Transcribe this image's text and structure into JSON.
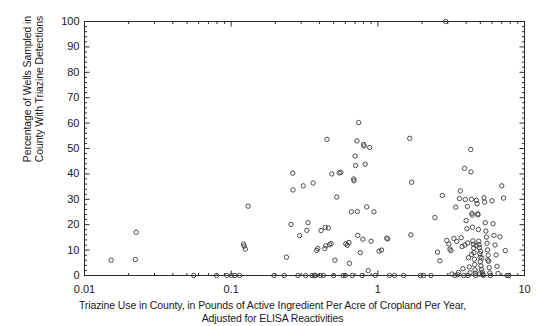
{
  "chart_data": {
    "type": "scatter",
    "title": "",
    "xlabel_lines": [
      "Triazine Use in County, in Pounds of Active Ingredient Per Acre of Cropland Per Year,",
      "Adjusted for ELISA Reactivities"
    ],
    "ylabel_lines": [
      "Percentage of Wells Sampled in",
      "County With Triazine Detections"
    ],
    "xlabel": "Triazine Use in County, in Pounds of Active Ingredient Per Acre of Cropland Per Year, Adjusted for ELISA Reactivities",
    "ylabel": "Percentage of Wells Sampled in County With Triazine Detections",
    "xscale": "log",
    "yscale": "linear",
    "xlim": [
      0.01,
      10
    ],
    "ylim": [
      0,
      100
    ],
    "xticks": [
      0.01,
      0.1,
      1,
      10
    ],
    "xtick_labels": [
      "0.01",
      "0.1",
      "1",
      "10"
    ],
    "yticks": [
      0,
      10,
      20,
      30,
      40,
      50,
      60,
      70,
      80,
      90,
      100
    ],
    "ytick_labels": [
      "0",
      "10",
      "20",
      "30",
      "40",
      "50",
      "60",
      "70",
      "80",
      "90",
      "100"
    ],
    "minor_ticks": true,
    "grid": false,
    "legend": null,
    "marker": "open-circle",
    "marker_color": "#3a3a3a",
    "marker_size": 4.4,
    "frame_color": "#2b2b2b",
    "background": "#ffffff",
    "points": [
      [
        0.0152,
        6.0
      ],
      [
        0.0222,
        6.3
      ],
      [
        0.0225,
        17.0
      ],
      [
        0.0555,
        0.0
      ],
      [
        0.0795,
        0.0
      ],
      [
        0.0935,
        0.0
      ],
      [
        0.1005,
        0.0
      ],
      [
        0.106,
        0.0
      ],
      [
        0.114,
        0.0
      ],
      [
        0.1215,
        12.4
      ],
      [
        0.1225,
        11.6
      ],
      [
        0.125,
        10.4
      ],
      [
        0.1305,
        27.3
      ],
      [
        0.196,
        0.0
      ],
      [
        0.23,
        0.0
      ],
      [
        0.238,
        7.2
      ],
      [
        0.256,
        20.1
      ],
      [
        0.263,
        40.3
      ],
      [
        0.264,
        33.7
      ],
      [
        0.285,
        0.0
      ],
      [
        0.293,
        15.7
      ],
      [
        0.31,
        35.3
      ],
      [
        0.322,
        0.0
      ],
      [
        0.328,
        17.8
      ],
      [
        0.334,
        20.8
      ],
      [
        0.356,
        0.0
      ],
      [
        0.362,
        36.4
      ],
      [
        0.37,
        0.0
      ],
      [
        0.376,
        0.0
      ],
      [
        0.382,
        9.9
      ],
      [
        0.39,
        10.6
      ],
      [
        0.405,
        0.0
      ],
      [
        0.41,
        17.7
      ],
      [
        0.425,
        0.0
      ],
      [
        0.435,
        10.6
      ],
      [
        0.442,
        11.7
      ],
      [
        0.45,
        53.6
      ],
      [
        0.46,
        18.7
      ],
      [
        0.47,
        12.1
      ],
      [
        0.48,
        12.6
      ],
      [
        0.485,
        40.0
      ],
      [
        0.5,
        0.0
      ],
      [
        0.51,
        6.0
      ],
      [
        0.525,
        30.9
      ],
      [
        0.545,
        40.4
      ],
      [
        0.56,
        40.6
      ],
      [
        0.58,
        0.0
      ],
      [
        0.6,
        0.0
      ],
      [
        0.62,
        11.9
      ],
      [
        0.635,
        13.0
      ],
      [
        0.64,
        4.8
      ],
      [
        0.66,
        25.1
      ],
      [
        0.67,
        0.0
      ],
      [
        0.685,
        38.0
      ],
      [
        0.688,
        37.3
      ],
      [
        0.7,
        47.0
      ],
      [
        0.705,
        43.3
      ],
      [
        0.72,
        53.0
      ],
      [
        0.725,
        25.2
      ],
      [
        0.73,
        15.8
      ],
      [
        0.74,
        60.2
      ],
      [
        0.76,
        9.0
      ],
      [
        0.78,
        0.0
      ],
      [
        0.8,
        51.6
      ],
      [
        0.805,
        51.0
      ],
      [
        0.82,
        43.8
      ],
      [
        0.84,
        27.0
      ],
      [
        0.86,
        1.9
      ],
      [
        0.88,
        50.4
      ],
      [
        0.9,
        13.5
      ],
      [
        0.94,
        25.1
      ],
      [
        0.96,
        0.0
      ],
      [
        1.02,
        9.6
      ],
      [
        1.06,
        10.0
      ],
      [
        1.15,
        14.7
      ],
      [
        1.17,
        14.4
      ],
      [
        1.2,
        0.0
      ],
      [
        1.5,
        0.0
      ],
      [
        1.65,
        54.0
      ],
      [
        1.68,
        16.0
      ],
      [
        1.7,
        36.7
      ],
      [
        1.95,
        0.0
      ],
      [
        2.3,
        0.0
      ],
      [
        2.45,
        22.8
      ],
      [
        2.55,
        9.2
      ],
      [
        2.65,
        5.8
      ],
      [
        2.75,
        31.5
      ],
      [
        2.9,
        100.0
      ],
      [
        2.95,
        13.8
      ],
      [
        3.1,
        10.4
      ],
      [
        3.15,
        9.8
      ],
      [
        3.2,
        0.6
      ],
      [
        3.3,
        14.6
      ],
      [
        3.35,
        0.0
      ],
      [
        3.4,
        26.9
      ],
      [
        3.45,
        13.4
      ],
      [
        3.5,
        0.3
      ],
      [
        3.55,
        1.2
      ],
      [
        3.6,
        30.3
      ],
      [
        3.65,
        33.3
      ],
      [
        3.7,
        14.9
      ],
      [
        3.75,
        11.4
      ],
      [
        3.8,
        2.7
      ],
      [
        3.85,
        0.0
      ],
      [
        3.9,
        42.2
      ],
      [
        3.95,
        29.9
      ],
      [
        4.0,
        21.6
      ],
      [
        4.05,
        18.4
      ],
      [
        4.1,
        12.8
      ],
      [
        4.15,
        7.0
      ],
      [
        4.2,
        3.4
      ],
      [
        4.25,
        1.1
      ],
      [
        4.3,
        49.6
      ],
      [
        4.32,
        40.8
      ],
      [
        4.35,
        30.0
      ],
      [
        4.38,
        24.5
      ],
      [
        4.4,
        23.8
      ],
      [
        4.42,
        19.0
      ],
      [
        4.45,
        13.6
      ],
      [
        4.48,
        12.3
      ],
      [
        4.5,
        10.8
      ],
      [
        4.52,
        9.0
      ],
      [
        4.55,
        6.4
      ],
      [
        4.58,
        4.3
      ],
      [
        4.6,
        2.2
      ],
      [
        4.62,
        0.9
      ],
      [
        4.65,
        0.0
      ],
      [
        4.7,
        29.6
      ],
      [
        4.75,
        28.3
      ],
      [
        4.8,
        24.3
      ],
      [
        4.82,
        23.9
      ],
      [
        4.85,
        18.1
      ],
      [
        4.88,
        13.5
      ],
      [
        4.9,
        12.1
      ],
      [
        4.92,
        11.0
      ],
      [
        4.95,
        8.6
      ],
      [
        4.98,
        7.2
      ],
      [
        5.0,
        5.4
      ],
      [
        5.05,
        3.8
      ],
      [
        5.1,
        2.4
      ],
      [
        5.15,
        1.3
      ],
      [
        5.2,
        0.4
      ],
      [
        5.25,
        0.0
      ],
      [
        5.3,
        30.6
      ],
      [
        5.35,
        28.9
      ],
      [
        5.4,
        20.8
      ],
      [
        5.45,
        17.5
      ],
      [
        5.5,
        15.1
      ],
      [
        5.55,
        12.7
      ],
      [
        5.6,
        10.1
      ],
      [
        5.65,
        8.0
      ],
      [
        5.7,
        5.6
      ],
      [
        5.75,
        3.1
      ],
      [
        5.8,
        1.0
      ],
      [
        5.85,
        0.0
      ],
      [
        6.0,
        29.4
      ],
      [
        6.1,
        20.4
      ],
      [
        6.2,
        15.8
      ],
      [
        6.3,
        12.0
      ],
      [
        6.4,
        8.1
      ],
      [
        6.5,
        3.6
      ],
      [
        6.6,
        0.8
      ],
      [
        6.8,
        15.2
      ],
      [
        7.0,
        35.3
      ],
      [
        7.2,
        30.5
      ],
      [
        7.4,
        9.8
      ],
      [
        7.6,
        0.0
      ],
      [
        7.8,
        0.0
      ],
      [
        2.05,
        0.0
      ],
      [
        1.3,
        0.0
      ],
      [
        0.79,
        14.3
      ],
      [
        0.605,
        12.5
      ],
      [
        0.438,
        18.9
      ],
      [
        3.92,
        12.0
      ],
      [
        4.08,
        27.2
      ],
      [
        4.68,
        11.8
      ],
      [
        5.02,
        9.5
      ],
      [
        5.62,
        6.1
      ],
      [
        4.36,
        8.3
      ],
      [
        4.94,
        0.6
      ],
      [
        5.12,
        6.9
      ],
      [
        3.05,
        12.4
      ],
      [
        4.12,
        0.0
      ]
    ]
  }
}
